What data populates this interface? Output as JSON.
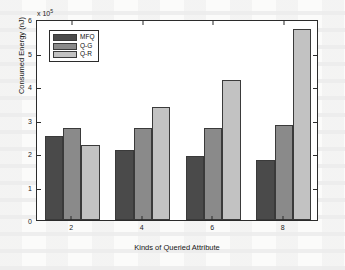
{
  "chart_data": {
    "type": "bar",
    "title": "",
    "xlabel": "Kinds of Queried Attribute",
    "ylabel": "Consumed Energy (nJ)",
    "y_multiplier": "x 10",
    "y_exponent": "5",
    "categories": [
      "2",
      "4",
      "6",
      "8"
    ],
    "xlim": [
      1,
      9
    ],
    "ylim": [
      0,
      6
    ],
    "yticks": [
      "0",
      "1",
      "2",
      "3",
      "4",
      "5",
      "6"
    ],
    "ytick_values": [
      0,
      1,
      2,
      3,
      4,
      5,
      6
    ],
    "grid": false,
    "legend_position": "upper left",
    "series": [
      {
        "name": "MFQ",
        "color": "#4a4a4a",
        "values": [
          2.5,
          2.1,
          1.9,
          1.8
        ]
      },
      {
        "name": "Q-G",
        "color": "#8a8a8a",
        "values": [
          2.75,
          2.75,
          2.75,
          2.85
        ]
      },
      {
        "name": "Q-R",
        "color": "#c2c2c2",
        "values": [
          2.23,
          3.38,
          4.17,
          5.7
        ]
      }
    ]
  },
  "figure": {
    "background_color": "#ffffff",
    "axis_color": "#2b2b2b"
  }
}
